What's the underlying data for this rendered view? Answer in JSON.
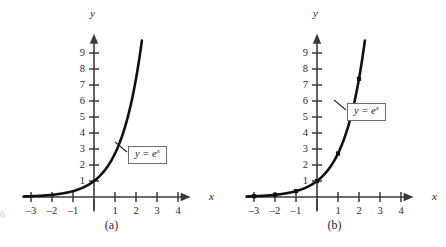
{
  "figure": {
    "background": "#ffffff",
    "curve_color": "#111111",
    "axis_color": "#3a3a38",
    "edge_artifact": "6"
  },
  "chart_data": [
    {
      "type": "line",
      "panel_id": "a",
      "caption": "(a)",
      "title": "",
      "xlabel": "x",
      "ylabel": "y",
      "function_label": "y = e",
      "function_exponent": "x",
      "xlim": [
        -3.4,
        4.6
      ],
      "ylim": [
        -0.9,
        10.2
      ],
      "xticks": [
        -3,
        -2,
        -1,
        1,
        2,
        3,
        4
      ],
      "yticks": [
        1,
        2,
        3,
        4,
        5,
        6,
        7,
        8,
        9
      ],
      "xtick_labels": [
        "-3",
        "-2",
        "-1",
        "1",
        "2",
        "3",
        "4"
      ],
      "ytick_labels": [
        "1",
        "2",
        "3",
        "4",
        "5",
        "6",
        "7",
        "8",
        "9"
      ],
      "grid": false,
      "legend": "none",
      "markers": false,
      "curve_domain": [
        -3.35,
        2.28
      ],
      "x": [
        -3.35,
        -3.0,
        -2.5,
        -2.0,
        -1.5,
        -1.0,
        -0.5,
        0.0,
        0.5,
        1.0,
        1.5,
        2.0,
        2.28
      ],
      "y": [
        0.035,
        0.05,
        0.082,
        0.135,
        0.223,
        0.368,
        0.607,
        1.0,
        1.649,
        2.718,
        4.482,
        7.389,
        9.776
      ]
    },
    {
      "type": "line",
      "panel_id": "b",
      "caption": "(b)",
      "title": "",
      "xlabel": "x",
      "ylabel": "y",
      "function_label": "y = e",
      "function_exponent": "x",
      "xlim": [
        -3.4,
        4.6
      ],
      "ylim": [
        -0.9,
        10.2
      ],
      "xticks": [
        -3,
        -2,
        -1,
        1,
        2,
        3,
        4
      ],
      "yticks": [
        1,
        2,
        3,
        4,
        5,
        6,
        7,
        8,
        9
      ],
      "xtick_labels": [
        "-3",
        "-2",
        "-1",
        "1",
        "2",
        "3",
        "4"
      ],
      "ytick_labels": [
        "1",
        "2",
        "3",
        "4",
        "5",
        "6",
        "7",
        "8",
        "9"
      ],
      "grid": false,
      "legend": "none",
      "markers": true,
      "curve_domain": [
        -3.35,
        2.28
      ],
      "x": [
        -3.35,
        -3.0,
        -2.5,
        -2.0,
        -1.5,
        -1.0,
        -0.5,
        0.0,
        0.5,
        1.0,
        1.5,
        2.0,
        2.28
      ],
      "y": [
        0.035,
        0.05,
        0.082,
        0.135,
        0.223,
        0.368,
        0.607,
        1.0,
        1.649,
        2.718,
        4.482,
        7.389,
        9.776
      ],
      "marker_points": [
        {
          "x": -3,
          "y": 0.05
        },
        {
          "x": -2,
          "y": 0.135
        },
        {
          "x": -1,
          "y": 0.368
        },
        {
          "x": 0,
          "y": 1.0
        },
        {
          "x": 1,
          "y": 2.718
        },
        {
          "x": 2,
          "y": 7.389
        }
      ]
    }
  ]
}
